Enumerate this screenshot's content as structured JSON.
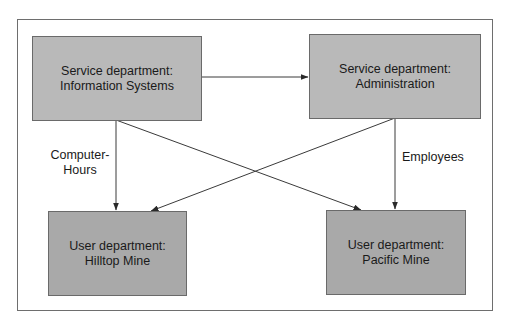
{
  "diagram": {
    "nodes": [
      {
        "id": "is",
        "line1": "Service department:",
        "line2": "Information Systems",
        "type": "service"
      },
      {
        "id": "admin",
        "line1": "Service department:",
        "line2": "Administration",
        "type": "service"
      },
      {
        "id": "hilltop",
        "line1": "User department:",
        "line2": "Hilltop Mine",
        "type": "user"
      },
      {
        "id": "pacific",
        "line1": "User department:",
        "line2": "Pacific Mine",
        "type": "user"
      }
    ],
    "edges": [
      {
        "from": "is",
        "to": "admin",
        "label": ""
      },
      {
        "from": "is",
        "to": "hilltop",
        "label": "Computer-Hours"
      },
      {
        "from": "is",
        "to": "pacific",
        "label": ""
      },
      {
        "from": "admin",
        "to": "hilltop",
        "label": ""
      },
      {
        "from": "admin",
        "to": "pacific",
        "label": "Employees"
      }
    ],
    "labels": {
      "computer_hours_line1": "Computer-",
      "computer_hours_line2": "Hours",
      "employees": "Employees"
    },
    "colors": {
      "service_fill": "#b9b9b9",
      "user_fill": "#a9a9a9",
      "line": "#3a3a3a"
    }
  }
}
